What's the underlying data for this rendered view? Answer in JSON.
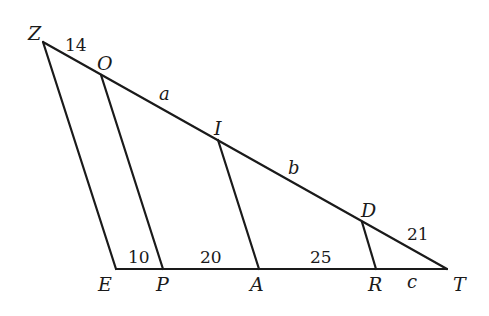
{
  "diagram": {
    "type": "geometry-parallel-lines-triangle",
    "vertices": {
      "Z": {
        "label": "Z",
        "x": 43,
        "y": 42
      },
      "O": {
        "label": "O",
        "x": 101,
        "y": 75
      },
      "I": {
        "label": "I",
        "x": 218,
        "y": 140
      },
      "D": {
        "label": "D",
        "x": 362,
        "y": 222
      },
      "T": {
        "label": "T",
        "x": 447,
        "y": 269
      },
      "E": {
        "label": "E",
        "x": 116,
        "y": 269
      },
      "P": {
        "label": "P",
        "x": 163,
        "y": 269
      },
      "A": {
        "label": "A",
        "x": 259,
        "y": 269
      },
      "R": {
        "label": "R",
        "x": 376,
        "y": 269
      }
    },
    "segments": [
      {
        "from": "Z",
        "to": "T",
        "name": "side-ZT"
      },
      {
        "from": "E",
        "to": "T",
        "name": "side-ET"
      },
      {
        "from": "Z",
        "to": "E",
        "name": "side-ZE"
      },
      {
        "from": "O",
        "to": "P",
        "name": "parallel-OP"
      },
      {
        "from": "I",
        "to": "A",
        "name": "parallel-IA"
      },
      {
        "from": "D",
        "to": "R",
        "name": "parallel-DR"
      }
    ],
    "segment_labels": {
      "ZO": "14",
      "OI": "a",
      "ID": "b",
      "DT": "21",
      "EP": "10",
      "PA": "20",
      "AR": "25",
      "RT": "c"
    }
  }
}
